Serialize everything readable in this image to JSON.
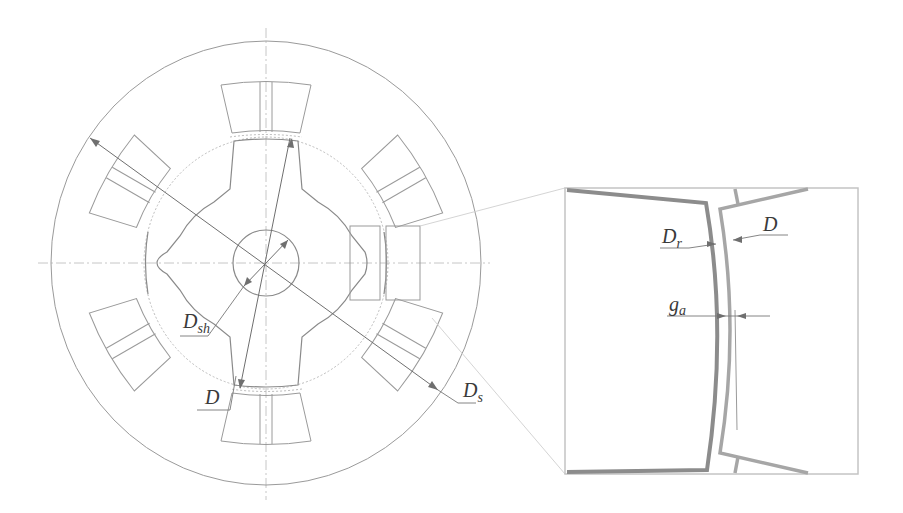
{
  "figure": {
    "main_view": {
      "labels": {
        "shaft_diameter": {
          "main": "D",
          "sub": "sh"
        },
        "bore_diameter": {
          "main": "D",
          "sub": ""
        },
        "stator_outer_diameter": {
          "main": "D",
          "sub": "s"
        }
      },
      "stator_poles": 6,
      "rotor_poles": 4
    },
    "detail_view": {
      "labels": {
        "rotor_diameter": {
          "main": "D",
          "sub": "r"
        },
        "bore_diameter": {
          "main": "D",
          "sub": ""
        },
        "air_gap": {
          "main": "g",
          "sub": "a"
        }
      }
    },
    "colors": {
      "line": "#9a9a9a",
      "dimension": "#6f6f6f",
      "rotor_edge": "#8c8c8c",
      "stator_edge": "#a6a6a6",
      "frame": "#c4c4c4",
      "background": "#ffffff"
    }
  }
}
